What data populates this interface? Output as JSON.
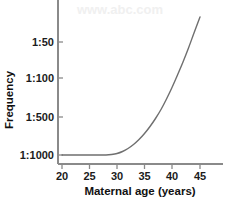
{
  "chart_data": {
    "type": "line",
    "title": "",
    "xlabel": "Maternal age (years)",
    "ylabel": "Frequency",
    "grid": false,
    "legend": "none",
    "xlim": [
      20,
      46
    ],
    "ylim_labels_note": "Y axis is a reversed frequency ratio scale; lower position = rarer (1:1000), higher position = more common (1:50)",
    "xticks": [
      20,
      25,
      30,
      35,
      40,
      45
    ],
    "xtick_labels": [
      "20",
      "25",
      "30",
      "35",
      "40",
      "45"
    ],
    "ytick_labels": [
      "1:50",
      "1:100",
      "1:500",
      "1:1000"
    ],
    "yticks_pixel_y": [
      42,
      78,
      117,
      155
    ],
    "series": [
      {
        "name": "Frequency of Down syndrome by maternal age",
        "x": [
          20,
          21,
          22,
          23,
          24,
          25,
          26,
          27,
          28,
          29,
          30,
          31,
          32,
          33,
          34,
          35,
          36,
          37,
          38,
          39,
          40,
          41,
          42,
          43,
          44,
          45
        ],
        "y_labels": [
          "1:1000",
          "1:1000",
          "1:1000",
          "1:1000",
          "1:1000",
          "1:1000",
          "1:1000",
          "1:1000",
          "1:1000",
          "1:950",
          "1:900",
          "1:820",
          "1:750",
          "1:650",
          "1:560",
          "1:480",
          "1:400",
          "1:330",
          "1:270",
          "1:210",
          "1:160",
          "1:120",
          "1:95",
          "1:70",
          "1:50",
          "1:35"
        ],
        "pixel_points": [
          [
            62,
            155
          ],
          [
            67.5,
            155
          ],
          [
            73,
            155
          ],
          [
            78.5,
            155
          ],
          [
            84,
            155
          ],
          [
            89.5,
            155
          ],
          [
            95,
            155
          ],
          [
            100.5,
            155
          ],
          [
            106,
            155
          ],
          [
            111.5,
            154.5
          ],
          [
            117,
            153.5
          ],
          [
            122.5,
            151.5
          ],
          [
            128,
            148.5
          ],
          [
            133.5,
            144.5
          ],
          [
            139,
            139.5
          ],
          [
            144.5,
            133.5
          ],
          [
            150,
            126.5
          ],
          [
            155.5,
            118.5
          ],
          [
            161,
            109.5
          ],
          [
            166.5,
            99
          ],
          [
            172,
            87.5
          ],
          [
            177.5,
            75
          ],
          [
            183,
            62
          ],
          [
            188.5,
            48
          ],
          [
            194,
            33
          ],
          [
            200,
            17
          ]
        ],
        "color": "#6f6f6f"
      }
    ]
  },
  "axes": {
    "y_axis_label": "Frequency",
    "x_axis_label": "Maternal age (years)",
    "axis_color": "#8a8a8a",
    "text_color": "#1b1b1b"
  },
  "watermark": {
    "text": "www.abc.com"
  }
}
